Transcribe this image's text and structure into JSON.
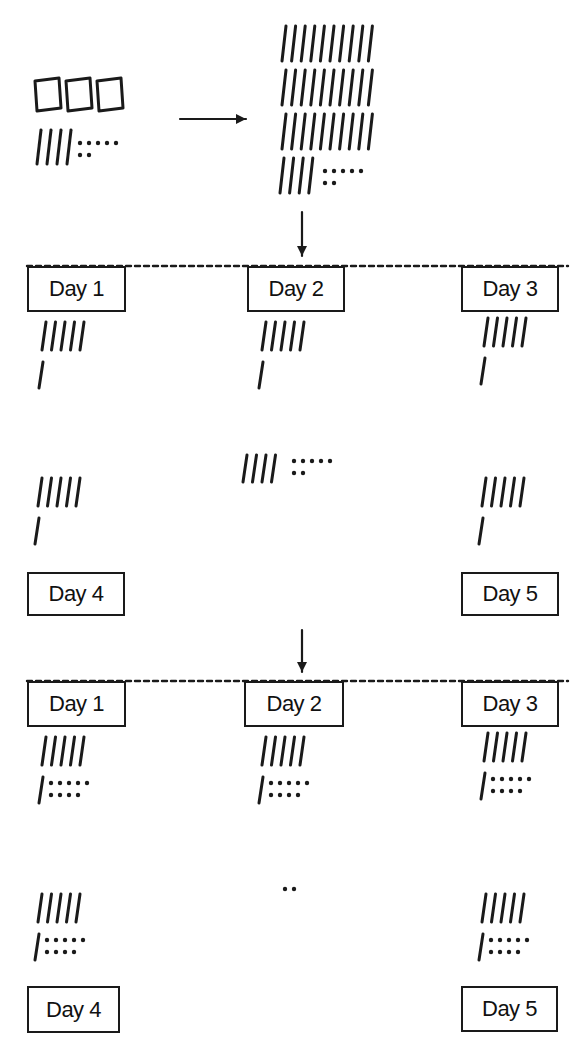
{
  "colors": {
    "ink": "#1a1a1a",
    "background": "#ffffff"
  },
  "start": {
    "label": "347 represented as base-ten blocks",
    "hundreds": 3,
    "tens": 4,
    "ones": 7,
    "pos": {
      "x": 35,
      "y": 78
    }
  },
  "regrouped": {
    "label": "347 regrouped as 34 tens and 7 ones",
    "tens_rows": [
      10,
      10,
      10,
      4
    ],
    "ones": 7,
    "pos": {
      "x": 282,
      "y": 26
    }
  },
  "arrows": [
    {
      "name": "arrow-right-icon",
      "x1": 180,
      "y1": 119,
      "x2": 246,
      "y2": 119
    },
    {
      "name": "arrow-down-icon",
      "x1": 302,
      "y1": 212,
      "x2": 302,
      "y2": 256
    },
    {
      "name": "arrow-down-icon",
      "x1": 302,
      "y1": 630,
      "x2": 302,
      "y2": 672
    }
  ],
  "stages": [
    {
      "name": "stage-tens-distributed",
      "top_line": {
        "y": 266,
        "x1": 27,
        "x2": 568
      },
      "days": [
        {
          "label": "Day 1",
          "box": {
            "x": 27,
            "y": 266,
            "w": 99,
            "h": 46
          },
          "tens": 6,
          "ones": 0,
          "marks": {
            "x": 42,
            "y": 322
          }
        },
        {
          "label": "Day 2",
          "box": {
            "x": 247,
            "y": 266,
            "w": 98,
            "h": 46
          },
          "tens": 6,
          "ones": 0,
          "marks": {
            "x": 262,
            "y": 322
          }
        },
        {
          "label": "Day 3",
          "box": {
            "x": 461,
            "y": 266,
            "w": 98,
            "h": 46
          },
          "tens": 6,
          "ones": 0,
          "marks": {
            "x": 484,
            "y": 318
          }
        },
        {
          "label": "Day 4",
          "box": {
            "x": 27,
            "y": 572,
            "w": 98,
            "h": 44
          },
          "tens": 6,
          "ones": 0,
          "marks": {
            "x": 38,
            "y": 478
          }
        },
        {
          "label": "Day 5",
          "box": {
            "x": 461,
            "y": 572,
            "w": 98,
            "h": 44
          },
          "tens": 6,
          "ones": 0,
          "marks": {
            "x": 482,
            "y": 478
          }
        }
      ],
      "remainder": {
        "tens": 4,
        "ones": 7,
        "pos": {
          "x": 243,
          "y": 455
        }
      }
    },
    {
      "name": "stage-ones-distributed",
      "top_line": {
        "y": 681,
        "x1": 27,
        "x2": 568
      },
      "days": [
        {
          "label": "Day 1",
          "box": {
            "x": 27,
            "y": 681,
            "w": 99,
            "h": 46
          },
          "tens": 6,
          "ones": 9,
          "marks": {
            "x": 42,
            "y": 737
          }
        },
        {
          "label": "Day 2",
          "box": {
            "x": 244,
            "y": 681,
            "w": 100,
            "h": 46
          },
          "tens": 6,
          "ones": 9,
          "marks": {
            "x": 262,
            "y": 737
          }
        },
        {
          "label": "Day 3",
          "box": {
            "x": 461,
            "y": 681,
            "w": 98,
            "h": 46
          },
          "tens": 6,
          "ones": 9,
          "marks": {
            "x": 484,
            "y": 733
          }
        },
        {
          "label": "Day 4",
          "box": {
            "x": 27,
            "y": 986,
            "w": 93,
            "h": 47
          },
          "tens": 6,
          "ones": 9,
          "marks": {
            "x": 38,
            "y": 894
          }
        },
        {
          "label": "Day 5",
          "box": {
            "x": 461,
            "y": 986,
            "w": 97,
            "h": 46
          },
          "tens": 6,
          "ones": 9,
          "marks": {
            "x": 482,
            "y": 894
          }
        }
      ],
      "remainder": {
        "tens": 0,
        "ones": 2,
        "pos": {
          "x": 285,
          "y": 889
        }
      }
    }
  ]
}
